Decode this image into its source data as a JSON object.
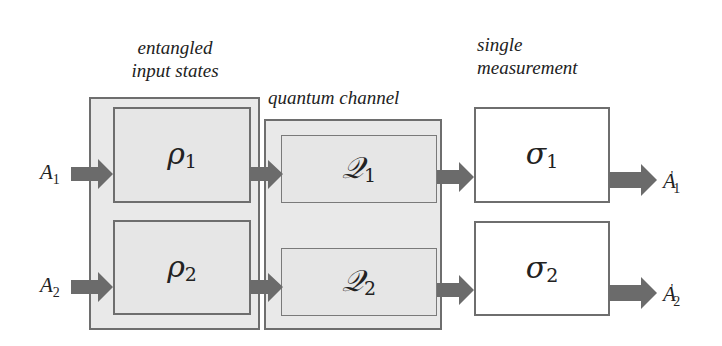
{
  "captions": {
    "entangled": [
      "entangled",
      "input states"
    ],
    "channel": "quantum channel",
    "measurement": [
      "single",
      "measurement"
    ]
  },
  "inputs": [
    {
      "base": "A",
      "sub": "1"
    },
    {
      "base": "A",
      "sub": "2"
    }
  ],
  "states": [
    {
      "base": "ρ",
      "sub": "1"
    },
    {
      "base": "ρ",
      "sub": "2"
    }
  ],
  "channels": [
    {
      "base": "𝒬",
      "sub": "1"
    },
    {
      "base": "𝒬",
      "sub": "2"
    }
  ],
  "measurements": [
    {
      "base": "σ",
      "sub": "1"
    },
    {
      "base": "σ",
      "sub": "2"
    }
  ],
  "outputs": [
    {
      "base": "A",
      "sub": "1",
      "prime": "'"
    },
    {
      "base": "A",
      "sub": "2",
      "prime": "'"
    }
  ],
  "colors": {
    "border": "#6e6e6e",
    "box_fill": "#e9e9e9",
    "arrow": "#6b6b6b"
  }
}
